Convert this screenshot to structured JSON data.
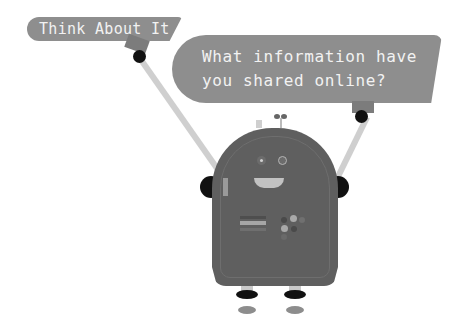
{
  "signs": {
    "left": {
      "text": "Think About It"
    },
    "right": {
      "lines": [
        "What information have",
        "you shared online?"
      ]
    }
  },
  "colors": {
    "background": "#ffffff",
    "sign": "#8e8e8e",
    "sign_text": "#f2f2f2",
    "robot_body": "#5f5f5f",
    "arm": "#cfcfcf",
    "joint": "#111111"
  }
}
